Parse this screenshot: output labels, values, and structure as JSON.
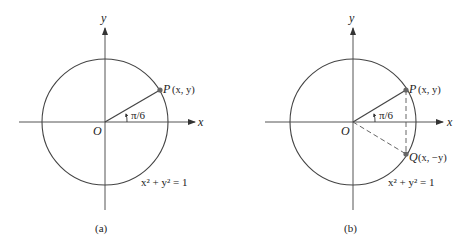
{
  "panels": [
    {
      "caption": "(a)",
      "x_axis_label": "x",
      "y_axis_label": "y",
      "origin_label": "O",
      "point_p_label": "P",
      "point_p_coords": "(x, y)",
      "angle_label": "π/6",
      "equation": "x² + y² = 1"
    },
    {
      "caption": "(b)",
      "x_axis_label": "x",
      "y_axis_label": "y",
      "origin_label": "O",
      "point_p_label": "P",
      "point_p_coords": "(x, y)",
      "point_q_label": "Q",
      "point_q_coords": "(x, −y)",
      "angle_label": "π/6",
      "equation": "x² + y² = 1"
    }
  ],
  "colors": {
    "line": "#3a3a3a",
    "point": "#666666"
  }
}
